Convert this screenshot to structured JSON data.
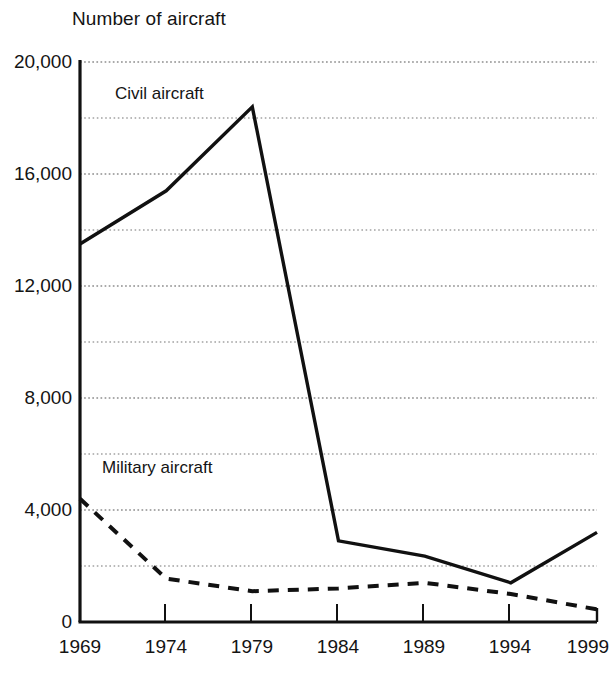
{
  "chart_data": {
    "type": "line",
    "title": "Number of aircraft",
    "xlabel": "",
    "ylabel": "Number of aircraft",
    "categories": [
      "1969",
      "1974",
      "1979",
      "1984",
      "1989",
      "1994",
      "1999"
    ],
    "x": [
      1969,
      1974,
      1979,
      1984,
      1989,
      1994,
      1999
    ],
    "series": [
      {
        "name": "Civil aircraft",
        "style": "solid",
        "color": "#111111",
        "values": [
          13500,
          15400,
          18400,
          2900,
          2350,
          1400,
          3200
        ]
      },
      {
        "name": "Military aircraft",
        "style": "dashed",
        "color": "#111111",
        "values": [
          4400,
          1550,
          1100,
          1200,
          1400,
          1000,
          450
        ]
      }
    ],
    "ylim": [
      0,
      20000
    ],
    "yticks": [
      0,
      4000,
      8000,
      12000,
      16000,
      20000
    ],
    "ytick_labels": [
      "0",
      "4,000",
      "8,000",
      "12,000",
      "16,000",
      "20,000"
    ],
    "minor_gridlines": [
      2000,
      6000,
      10000,
      14000,
      18000
    ],
    "grid": true,
    "grid_style": "dotted",
    "legend": "inline-labels",
    "annotations": [
      {
        "text": "Civil aircraft",
        "x": 1971.2,
        "y": 19000
      },
      {
        "text": "Military aircraft",
        "x": 1970.6,
        "y": 5600
      }
    ]
  },
  "axis": {
    "title": "Number of aircraft",
    "y_labels": [
      "20,000",
      "16,000",
      "12,000",
      "8,000",
      "4,000",
      "0"
    ],
    "x_labels": [
      "1969",
      "1974",
      "1979",
      "1984",
      "1989",
      "1994",
      "1999"
    ]
  },
  "labels": {
    "civil": "Civil aircraft",
    "military": "Military aircraft"
  },
  "colors": {
    "line": "#111111",
    "grid": "#9a9a9a",
    "axis": "#111111",
    "background": "#ffffff"
  }
}
